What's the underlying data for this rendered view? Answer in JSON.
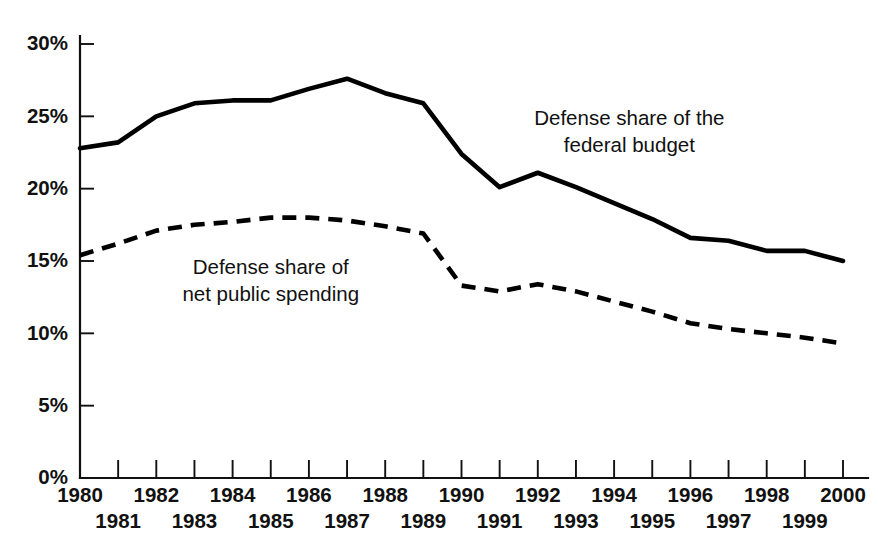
{
  "chart_data": {
    "type": "line",
    "title": "",
    "subtitle": "",
    "xlabel": "",
    "ylabel": "",
    "grid": false,
    "legend_position": "inline-annotations",
    "xlim": [
      1980,
      2000
    ],
    "ylim": [
      0,
      30
    ],
    "x": [
      1980,
      1981,
      1982,
      1983,
      1984,
      1985,
      1986,
      1987,
      1988,
      1989,
      1990,
      1991,
      1992,
      1993,
      1994,
      1995,
      1996,
      1997,
      1998,
      1999,
      2000
    ],
    "x_tick_labels_top": [
      "1980",
      "1982",
      "1984",
      "1986",
      "1988",
      "1990",
      "1992",
      "1994",
      "1996",
      "1998",
      "2000"
    ],
    "x_tick_labels_bottom": [
      "1981",
      "1983",
      "1985",
      "1987",
      "1989",
      "1991",
      "1993",
      "1995",
      "1997",
      "1999"
    ],
    "y_tick_labels": [
      "30%",
      "25%",
      "20%",
      "15%",
      "10%",
      "5%",
      "0%"
    ],
    "y_ticks": [
      30,
      25,
      20,
      15,
      10,
      5,
      0
    ],
    "series": [
      {
        "name": "Defense share of the federal budget",
        "style": "solid",
        "color": "#000000",
        "values": [
          22.8,
          23.2,
          25.0,
          25.9,
          26.1,
          26.1,
          26.9,
          27.6,
          26.6,
          25.9,
          22.4,
          20.1,
          21.1,
          20.1,
          19.0,
          17.9,
          16.6,
          16.4,
          15.7,
          15.7,
          15.0
        ]
      },
      {
        "name": "Defense share of net public spending",
        "style": "dashed",
        "color": "#000000",
        "values": [
          15.4,
          16.2,
          17.1,
          17.5,
          17.7,
          18.0,
          18.0,
          17.8,
          17.4,
          16.9,
          13.3,
          12.9,
          13.4,
          12.9,
          12.2,
          11.5,
          10.7,
          10.3,
          10.0,
          9.7,
          9.3
        ]
      }
    ],
    "annotations": [
      {
        "name": "federal-budget-label",
        "lines": [
          "Defense share of the",
          "federal budget"
        ],
        "anchor_x": 1994.4,
        "anchor_y": 24.4
      },
      {
        "name": "net-public-spending-label",
        "lines": [
          "Defense share of",
          "net public spending"
        ],
        "anchor_x": 1985.0,
        "anchor_y": 14.1
      }
    ]
  },
  "colors": {
    "background": "#ffffff",
    "ink": "#111111",
    "series": "#000000"
  }
}
